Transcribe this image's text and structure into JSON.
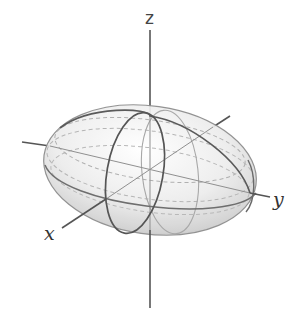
{
  "figure": {
    "type": "3d-ellipsoid-diagram",
    "axes": {
      "z": {
        "label": "z"
      },
      "y": {
        "label": "y"
      },
      "x": {
        "label": "x"
      }
    },
    "colors": {
      "axis": "#555555",
      "outline": "#4a4a4a",
      "surface_light": "#f4f4f4",
      "surface_dark": "#b8b8b8",
      "grid": "#9a9a9a",
      "label": "#333333"
    }
  }
}
